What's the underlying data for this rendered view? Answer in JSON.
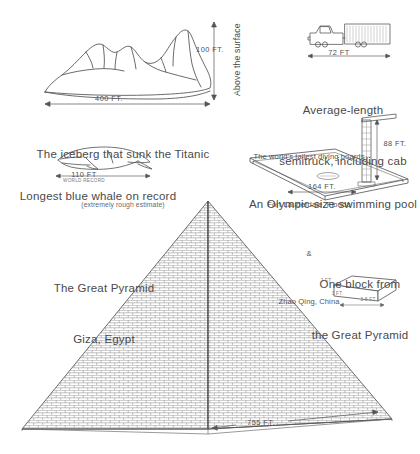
{
  "page": {
    "background_color": "#ffffff",
    "ink_color": "#4a4a4a"
  },
  "items": {
    "iceberg": {
      "caption": "The iceberg that sunk the Titanic",
      "caption_sub": "(extremely rough estimate)",
      "height_label": "100 FT.",
      "height_axis_label": "Above the surface",
      "width_label": "400 FT."
    },
    "whale": {
      "caption": "Longest blue whale on record",
      "length_label": "110 FT",
      "length_sublabel": "WORLD RECORD"
    },
    "truck": {
      "caption_line1": "Average-length",
      "caption_line2": "semitruck, including cab",
      "length_label": "72 FT"
    },
    "pool": {
      "note_line1": "The world's tallest diving boards",
      "note_line2": "Fort Lauderdale, Florida",
      "note_line3": "&",
      "note_line4": "Zhao Qing, China",
      "caption": "An Olympic-size swimming pool",
      "width_label": "164 FT.",
      "height_label": "88 FT."
    },
    "pyramid": {
      "caption_line1": "The Great Pyramid",
      "caption_line2": "Giza, Egypt",
      "base_label": "755 FT."
    },
    "block": {
      "caption_line1": "One block from",
      "caption_line2": "the Great Pyramid",
      "length_label": "3.5 FT",
      "depth_label": "3 FT",
      "height_label": "2 FT"
    }
  }
}
